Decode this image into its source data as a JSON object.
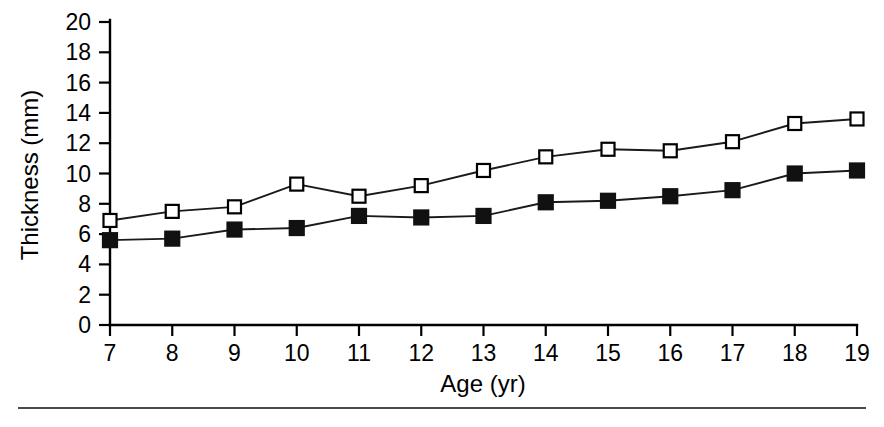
{
  "chart_data": {
    "type": "line",
    "title": "",
    "subtitle": "",
    "xlabel": "Age (yr)",
    "ylabel": "Thickness (mm)",
    "x": [
      7,
      8,
      9,
      10,
      11,
      12,
      13,
      14,
      15,
      16,
      17,
      18,
      19
    ],
    "categories": [
      "7",
      "8",
      "9",
      "10",
      "11",
      "12",
      "13",
      "14",
      "15",
      "16",
      "17",
      "18",
      "19"
    ],
    "xlim": [
      7,
      19
    ],
    "ylim": [
      0,
      20
    ],
    "xticks": [
      7,
      8,
      9,
      10,
      11,
      12,
      13,
      14,
      15,
      16,
      17,
      18,
      19
    ],
    "xtick_labels": [
      "7",
      "8",
      "9",
      "10",
      "11",
      "12",
      "13",
      "14",
      "15",
      "16",
      "17",
      "18",
      "19"
    ],
    "yticks": [
      0,
      2,
      4,
      6,
      8,
      10,
      12,
      14,
      16,
      18,
      20
    ],
    "ytick_labels": [
      "0",
      "2",
      "4",
      "6",
      "8",
      "10",
      "12",
      "14",
      "16",
      "18",
      "20"
    ],
    "grid": false,
    "legend": "none",
    "series": [
      {
        "name": "open-square-series",
        "marker": "open-square",
        "values": [
          6.9,
          7.5,
          7.8,
          9.3,
          8.5,
          9.2,
          10.2,
          11.1,
          11.6,
          11.5,
          12.1,
          13.3,
          13.6
        ]
      },
      {
        "name": "filled-square-series",
        "marker": "filled-square",
        "values": [
          5.6,
          5.7,
          6.3,
          6.4,
          7.2,
          7.1,
          7.2,
          8.1,
          8.2,
          8.5,
          8.9,
          10.0,
          10.2
        ]
      }
    ],
    "colors": {
      "line": "#1a1a1a",
      "marker_open_fill": "#ffffff",
      "marker_filled_fill": "#111111",
      "axis": "#000000",
      "background": "#ffffff"
    }
  }
}
